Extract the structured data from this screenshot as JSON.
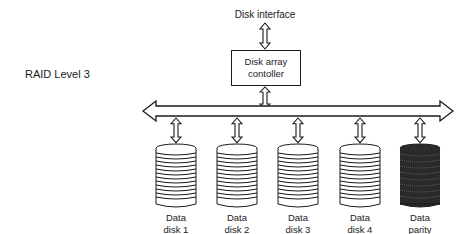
{
  "title": "RAID Level 3",
  "interface_label": "Disk interface",
  "controller": {
    "line1": "Disk array",
    "line2": "contoller"
  },
  "disks": [
    {
      "line1": "Data",
      "line2": "disk 1",
      "line3": "",
      "type": "data"
    },
    {
      "line1": "Data",
      "line2": "disk 2",
      "line3": "",
      "type": "data"
    },
    {
      "line1": "Data",
      "line2": "disk 3",
      "line3": "",
      "type": "data"
    },
    {
      "line1": "Data",
      "line2": "disk 4",
      "line3": "",
      "type": "data"
    },
    {
      "line1": "Data",
      "line2": "parity",
      "line3": "bits",
      "type": "parity"
    }
  ],
  "colors": {
    "ink": "#1a1a1a",
    "background": "#ffffff"
  }
}
